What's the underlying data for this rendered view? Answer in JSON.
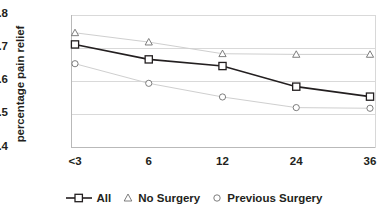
{
  "chart_data": {
    "type": "line",
    "title": "",
    "xlabel": "",
    "ylabel": "percentage pain relief",
    "categories": [
      "<3",
      "6",
      "12",
      "24",
      "36"
    ],
    "xtick_labels": [
      "<3",
      "6",
      "12",
      "24",
      "36"
    ],
    "ytick_labels": [
      "0.8",
      "0.7",
      "0.6",
      "0.5",
      "0.4"
    ],
    "ytick_values": [
      0.8,
      0.7,
      0.6,
      0.5,
      0.4
    ],
    "ylim": [
      0.4,
      0.8
    ],
    "grid": "horizontal",
    "legend_position": "bottom",
    "series": [
      {
        "name": "All",
        "marker": "square",
        "line_color": "#231f20",
        "values": [
          0.71,
          0.665,
          0.645,
          0.583,
          0.553
        ]
      },
      {
        "name": "No Surgery",
        "marker": "triangle",
        "line_color": "#cfcfcf",
        "values": [
          0.745,
          0.717,
          0.682,
          0.68,
          0.68
        ]
      },
      {
        "name": "Previous Surgery",
        "marker": "circle",
        "line_color": "#cfcfcf",
        "values": [
          0.652,
          0.593,
          0.552,
          0.52,
          0.518
        ]
      }
    ]
  },
  "legend": {
    "items": [
      {
        "label": "All",
        "marker": "square-with-line-icon"
      },
      {
        "label": "No Surgery",
        "marker": "triangle-icon"
      },
      {
        "label": "Previous Surgery",
        "marker": "circle-icon"
      }
    ]
  },
  "colors": {
    "ink": "#231f20",
    "grid": "#d9d9d9",
    "light_series": "#cfcfcf",
    "background": "#ffffff"
  }
}
